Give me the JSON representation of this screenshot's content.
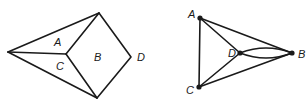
{
  "figures": [
    {
      "name": "planar-map",
      "regions": [
        {
          "label": "A",
          "x": 57,
          "y": 46
        },
        {
          "label": "C",
          "x": 56,
          "y": 70
        },
        {
          "label": "B",
          "x": 94,
          "y": 61
        },
        {
          "label": "D",
          "x": 138,
          "y": 62
        }
      ]
    },
    {
      "name": "dual-graph",
      "vertices": [
        {
          "label": "A",
          "x": 200,
          "y": 18,
          "lx": 188,
          "ly": 18
        },
        {
          "label": "D",
          "x": 240,
          "y": 53,
          "lx": 228,
          "ly": 57
        },
        {
          "label": "B",
          "x": 292,
          "y": 53,
          "lx": 298,
          "ly": 58
        },
        {
          "label": "C",
          "x": 199,
          "y": 87,
          "lx": 185,
          "ly": 94
        }
      ],
      "edges": [
        [
          "A",
          "C"
        ],
        [
          "A",
          "B"
        ],
        [
          "A",
          "D"
        ],
        [
          "C",
          "B"
        ],
        [
          "C",
          "D"
        ],
        [
          "D",
          "B"
        ],
        [
          "D",
          "B"
        ]
      ]
    }
  ]
}
